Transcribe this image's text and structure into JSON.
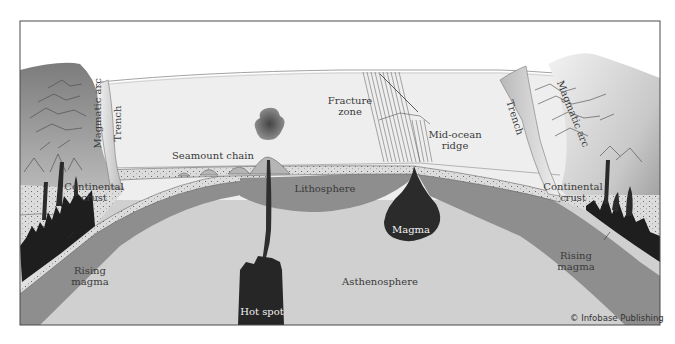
{
  "diagram": {
    "labels": {
      "magmatic_arc_left": "Magmatic arc",
      "trench_left": "Trench",
      "continental_crust_left_1": "Continental",
      "continental_crust_left_2": "crust",
      "rising_magma_left_1": "Rising",
      "rising_magma_left_2": "magma",
      "seamount_chain": "Seamount chain",
      "fracture_zone_1": "Fracture",
      "fracture_zone_2": "zone",
      "mid_ocean_ridge_1": "Mid-ocean",
      "mid_ocean_ridge_2": "ridge",
      "lithosphere": "Lithosphere",
      "magma": "Magma",
      "asthenosphere": "Asthenosphere",
      "hot_spot": "Hot spot",
      "trench_right": "Trench",
      "magmatic_arc_right": "Magmatic arc",
      "continental_crust_right_1": "Continental",
      "continental_crust_right_2": "crust",
      "rising_magma_right_1": "Rising",
      "rising_magma_right_2": "magma"
    },
    "credit": "© Infobase Publishing",
    "colors": {
      "frame": "#4a4a4a",
      "ocean_water": "#ededed",
      "sky": "#ffffff",
      "asthenosphere": "#cfcfcf",
      "lithosphere": "#8f8f8f",
      "crust_sediment": "#d9d9d9",
      "continent_dark": "#7a7a7a",
      "continent_light": "#e6e6e6",
      "magma": "#2a2a2a"
    }
  }
}
